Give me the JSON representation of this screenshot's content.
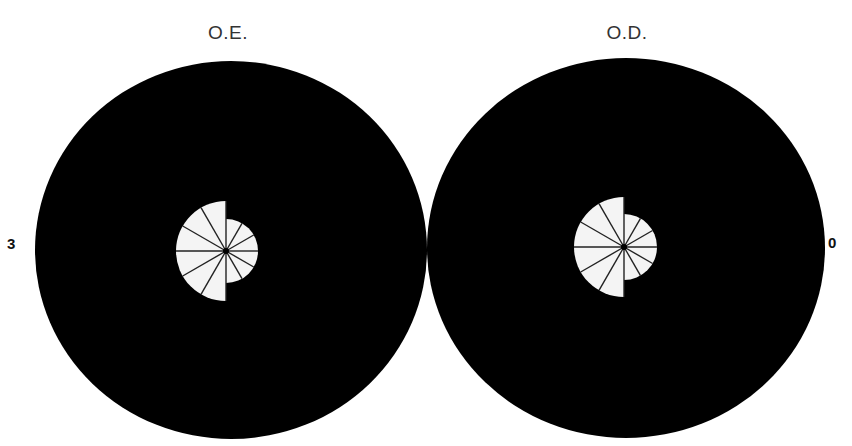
{
  "labels": {
    "left_eye": "O.E.",
    "right_eye": "O.D.",
    "left_side_mark": "3",
    "right_side_mark": "0"
  },
  "colors": {
    "background": "#ffffff",
    "field": "#000000",
    "preserved_area": "#f4f4f4",
    "spokes": "#222222"
  },
  "fields": [
    {
      "eye": "O.E.",
      "center": [
        231,
        250
      ],
      "radius_x": 196,
      "radius_y": 189,
      "fixation": [
        226,
        251
      ],
      "large_half_radius": 50,
      "large_half_side": "left",
      "small_half_radius": 32,
      "small_half_side": "right"
    },
    {
      "eye": "O.D.",
      "center": [
        626,
        248
      ],
      "radius_x": 199,
      "radius_y": 190,
      "fixation": [
        624,
        247
      ],
      "large_half_radius": 50,
      "large_half_side": "left",
      "small_half_radius": 33,
      "small_half_side": "right"
    }
  ]
}
